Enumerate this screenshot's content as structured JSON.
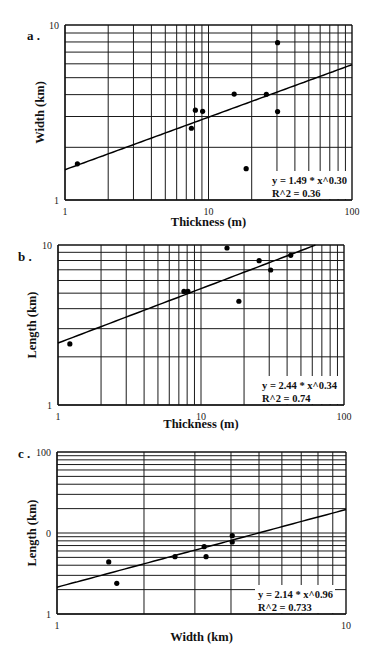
{
  "page": {
    "top_text": ""
  },
  "chart_data": [
    {
      "type": "scatter",
      "panel_label": "a .",
      "title": "",
      "xlabel": "Thickness (m)",
      "ylabel": "Width (km)",
      "xscale": "log",
      "yscale": "log",
      "xlim": [
        1,
        100
      ],
      "ylim": [
        1,
        10
      ],
      "x_tick_labels": [
        "1",
        "10",
        "100"
      ],
      "x_tick_values": [
        1,
        10,
        100
      ],
      "y_tick_labels": [
        "1",
        "10"
      ],
      "y_tick_values": [
        1,
        10
      ],
      "grid": true,
      "points": [
        {
          "x": 1.22,
          "y": 1.61
        },
        {
          "x": 7.6,
          "y": 2.57
        },
        {
          "x": 8.1,
          "y": 3.26
        },
        {
          "x": 9.1,
          "y": 3.21
        },
        {
          "x": 15.1,
          "y": 4.03
        },
        {
          "x": 18.3,
          "y": 1.51
        },
        {
          "x": 25.3,
          "y": 4.02
        },
        {
          "x": 30.3,
          "y": 7.92
        },
        {
          "x": 30.3,
          "y": 3.2
        }
      ],
      "fit": {
        "a": 1.49,
        "b": 0.3
      },
      "annotations": [
        "y = 1.49 * x^0.30",
        "R^2 = 0.36"
      ],
      "annotation_position": "bottom-right"
    },
    {
      "type": "scatter",
      "panel_label": "b .",
      "title": "",
      "xlabel": "Thickness (m)",
      "ylabel": "Length (km)",
      "xscale": "log",
      "yscale": "log",
      "xlim": [
        1,
        100
      ],
      "ylim": [
        1,
        10
      ],
      "x_tick_labels": [
        "1",
        "10",
        "100"
      ],
      "x_tick_values": [
        1,
        10,
        100
      ],
      "y_tick_labels": [
        "1",
        "10"
      ],
      "y_tick_values": [
        1,
        10
      ],
      "grid": true,
      "points": [
        {
          "x": 1.21,
          "y": 2.41
        },
        {
          "x": 7.6,
          "y": 5.13
        },
        {
          "x": 8.1,
          "y": 5.13
        },
        {
          "x": 15.2,
          "y": 9.58
        },
        {
          "x": 18.4,
          "y": 4.45
        },
        {
          "x": 25.5,
          "y": 7.98
        },
        {
          "x": 30.7,
          "y": 6.98
        },
        {
          "x": 42.4,
          "y": 8.62
        }
      ],
      "fit": {
        "a": 2.44,
        "b": 0.34
      },
      "annotations": [
        "y = 2.44 * x^0.34",
        "R^2 = 0.74"
      ],
      "annotation_position": "bottom-right"
    },
    {
      "type": "scatter",
      "panel_label": "c .",
      "title": "",
      "xlabel": "Width (km)",
      "ylabel": "Length (km)",
      "xscale": "log",
      "yscale": "log",
      "xlim": [
        1,
        10
      ],
      "ylim": [
        1,
        100
      ],
      "x_tick_labels": [
        "1",
        "10"
      ],
      "x_tick_values": [
        1,
        10
      ],
      "y_tick_labels": [
        "1",
        "0",
        "100"
      ],
      "y_tick_values": [
        1,
        10,
        100
      ],
      "grid": true,
      "points": [
        {
          "x": 1.51,
          "y": 4.39
        },
        {
          "x": 1.61,
          "y": 2.39
        },
        {
          "x": 2.56,
          "y": 5.1
        },
        {
          "x": 3.23,
          "y": 6.78
        },
        {
          "x": 3.28,
          "y": 5.1
        },
        {
          "x": 4.04,
          "y": 9.26
        },
        {
          "x": 4.04,
          "y": 7.74
        }
      ],
      "fit": {
        "a": 2.14,
        "b": 0.96
      },
      "annotations": [
        "y = 2.14 * x^0.96",
        "R^2 = 0.733"
      ],
      "annotation_position": "bottom-right"
    }
  ]
}
